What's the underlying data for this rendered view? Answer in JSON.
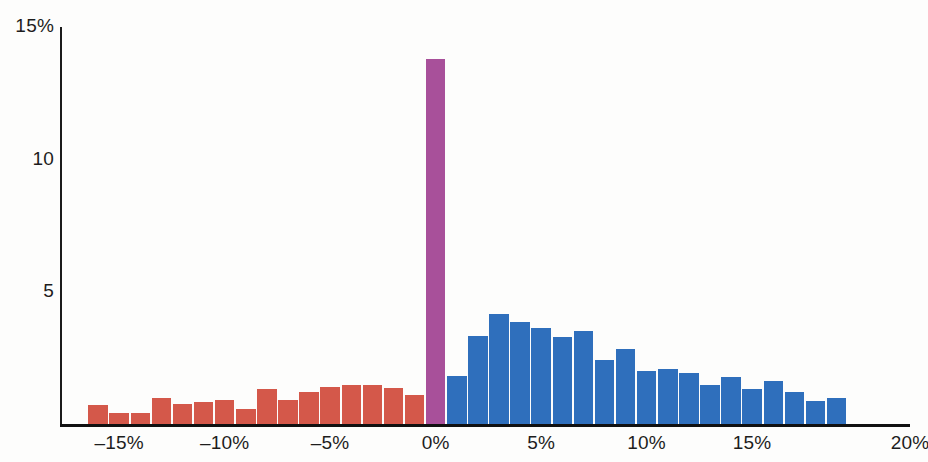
{
  "chart_data": {
    "type": "bar",
    "title": "",
    "subtitle": "",
    "xlabel": "",
    "ylabel": "",
    "xlim": [
      -16,
      20
    ],
    "ylim": [
      0,
      15
    ],
    "grid": false,
    "legend": null,
    "x_tick_labels": [
      "–15%",
      "–10%",
      "–5%",
      "0%",
      "5%",
      "10%",
      "15%",
      "20%"
    ],
    "x_tick_values": [
      -15,
      -10,
      -5,
      0,
      5,
      10,
      15,
      20
    ],
    "y_tick_labels": [
      "15%",
      "10",
      "5"
    ],
    "y_tick_values": [
      15,
      10,
      5
    ],
    "bin_width": 1,
    "colors": {
      "negative": "#d4584a",
      "zero": "#a8509a",
      "positive": "#2f6fbc",
      "axis": "#1b1b1b",
      "text": "#1d1d1d",
      "background": "#fdfdfc"
    },
    "categories": [
      -16,
      -15,
      -14,
      -13,
      -12,
      -11,
      -10,
      -9,
      -8,
      -7,
      -6,
      -5,
      -4,
      -3,
      -2,
      -1,
      0,
      1,
      2,
      3,
      4,
      5,
      6,
      7,
      8,
      9,
      10,
      11,
      12,
      13,
      14,
      15,
      16,
      17,
      18,
      19
    ],
    "values": [
      0.75,
      0.45,
      0.45,
      1.0,
      0.8,
      0.85,
      0.95,
      0.6,
      1.35,
      0.95,
      1.25,
      1.45,
      1.5,
      1.5,
      1.4,
      1.15,
      13.8,
      1.85,
      3.35,
      4.2,
      3.9,
      3.65,
      3.3,
      3.55,
      2.45,
      2.85,
      2.05,
      2.1,
      1.95,
      1.5,
      1.8,
      1.35,
      1.65,
      1.25,
      0.9,
      1.0
    ],
    "bar_colors": [
      "negative",
      "negative",
      "negative",
      "negative",
      "negative",
      "negative",
      "negative",
      "negative",
      "negative",
      "negative",
      "negative",
      "negative",
      "negative",
      "negative",
      "negative",
      "negative",
      "zero",
      "positive",
      "positive",
      "positive",
      "positive",
      "positive",
      "positive",
      "positive",
      "positive",
      "positive",
      "positive",
      "positive",
      "positive",
      "positive",
      "positive",
      "positive",
      "positive",
      "positive",
      "positive",
      "positive"
    ]
  }
}
